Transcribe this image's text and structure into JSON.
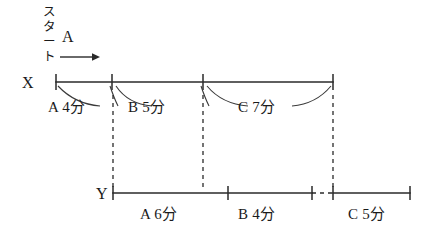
{
  "figure": {
    "title_text_vertical": "スタート",
    "direction_label": "A",
    "direction_arrow": "right-arrow",
    "axes": [
      {
        "id": "x",
        "label": "X",
        "segments": [
          {
            "label": "A 4分",
            "person": "A",
            "minutes": 4,
            "x_start": 56,
            "x_end": 112
          },
          {
            "label": "B 5分",
            "person": "B",
            "minutes": 5,
            "x_start": 112,
            "x_end": 203
          },
          {
            "label": "C 7分",
            "person": "C",
            "minutes": 7,
            "x_start": 203,
            "x_end": 333
          }
        ],
        "line_y": 82,
        "x_start": 56,
        "x_end": 333
      },
      {
        "id": "y",
        "label": "Y",
        "segments": [
          {
            "label": "A 6分",
            "person": "A",
            "minutes": 6,
            "x_start": 113,
            "x_end": 228
          },
          {
            "label": "B 4分",
            "person": "B",
            "minutes": 4,
            "x_start": 228,
            "x_end": 312
          },
          {
            "label": "C 5分",
            "person": "C",
            "minutes": 5,
            "x_start": 333,
            "x_end": 410
          }
        ],
        "line_y": 193,
        "x_start": 113,
        "x_end": 410,
        "gap_start": 312,
        "gap_end": 333
      }
    ],
    "connector_dashes": [
      {
        "from_x": 113,
        "y_top": 84,
        "y_bottom": 191
      },
      {
        "from_x": 203,
        "y_top": 84,
        "y_bottom": 191
      },
      {
        "from_x": 333,
        "y_top": 84,
        "y_bottom": 191
      }
    ],
    "colors": {
      "ink": "#1a1a1a",
      "line": "#2a2a2a",
      "background": "#ffffff"
    }
  }
}
